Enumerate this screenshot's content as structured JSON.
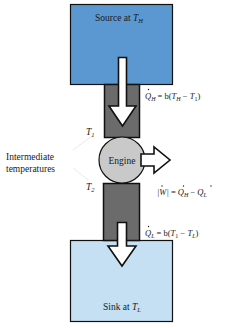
{
  "colors": {
    "source_fill": "#5b98d1",
    "sink_fill": "#c4e0f2",
    "conductor_fill": "#6b6b6b",
    "engine_fill": "#c9c9c9",
    "arrow_fill": "#ffffff",
    "outline": "#111111"
  },
  "source": {
    "label_prefix": "Source at ",
    "temp_symbol": "T",
    "temp_sub": "H"
  },
  "sink": {
    "label_prefix": "Sink at ",
    "temp_symbol": "T",
    "temp_sub": "L"
  },
  "engine": {
    "label": "Engine"
  },
  "intermediate": {
    "line1": "Intermediate",
    "line2": "temperatures",
    "t1_symbol": "T",
    "t1_sub": "1",
    "t2_symbol": "T",
    "t2_sub": "2"
  },
  "equations": {
    "q_h": {
      "lhs_symbol": "Q",
      "lhs_sub": "H",
      "rhs_prefix": " = b(",
      "rhs_t_a": "T",
      "rhs_t_a_sub": "H",
      "rhs_minus": " − ",
      "rhs_t_b": "T",
      "rhs_t_b_sub": "1",
      "rhs_close": ")"
    },
    "w": {
      "lhs": "|W|",
      "eq": " = ",
      "q_a": "Q",
      "q_a_sub": "H",
      "minus": " − ",
      "q_b": "Q",
      "q_b_sub": "L"
    },
    "q_l": {
      "lhs_symbol": "Q",
      "lhs_sub": "L",
      "rhs_prefix": " = b(",
      "rhs_t_a": "T",
      "rhs_t_a_sub": "1",
      "rhs_minus": " − ",
      "rhs_t_b": "T",
      "rhs_t_b_sub": "L",
      "rhs_close": ")"
    }
  }
}
